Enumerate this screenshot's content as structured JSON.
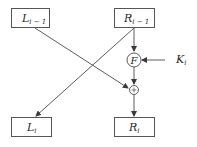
{
  "diagram": {
    "colors": {
      "stroke": "#4a4a4a",
      "text": "#2a2a2a",
      "background": "#ffffff"
    },
    "nodes": {
      "L_prev": {
        "base": "L",
        "sub": "i − 1"
      },
      "R_prev": {
        "base": "R",
        "sub": "i − 1"
      },
      "L_next": {
        "base": "L",
        "sub": "i"
      },
      "R_next": {
        "base": "R",
        "sub": "i"
      },
      "F": {
        "label": "F"
      },
      "xor": {
        "label": "+"
      },
      "key": {
        "base": "K",
        "sub": "i"
      }
    },
    "edges": [
      {
        "from": "R_prev",
        "to": "F"
      },
      {
        "from": "key",
        "to": "F"
      },
      {
        "from": "F",
        "to": "xor"
      },
      {
        "from": "L_prev",
        "to": "xor"
      },
      {
        "from": "xor",
        "to": "R_next"
      },
      {
        "from": "R_prev",
        "to": "L_next"
      }
    ]
  }
}
